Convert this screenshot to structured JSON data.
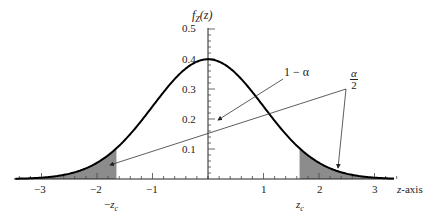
{
  "chart_data": {
    "type": "area",
    "title": "",
    "xlabel": "z-axis",
    "ylabel": "f_Z(z)",
    "xlim": [
      -3.5,
      3.5
    ],
    "ylim": [
      0,
      0.5
    ],
    "grid": false,
    "x_ticks": [
      -3,
      -2,
      -1,
      1,
      2,
      3
    ],
    "x_tick_labels": [
      "−3",
      "−2",
      "−1",
      "1",
      "2",
      "3"
    ],
    "y_ticks": [
      0.1,
      0.2,
      0.3,
      0.4,
      0.5
    ],
    "y_tick_labels": [
      "0.1",
      "0.2",
      "0.3",
      "0.4",
      "0.5"
    ],
    "series": [
      {
        "name": "standard normal density",
        "function": "exp(-z^2/2)/sqrt(2*pi)",
        "peak": 0.399
      }
    ],
    "critical_values": {
      "lower": -1.65,
      "upper": 1.65
    },
    "shaded_regions": [
      {
        "from": -3.5,
        "to": -1.65,
        "label": "α/2"
      },
      {
        "from": 1.65,
        "to": 3.5,
        "label": "α/2"
      }
    ],
    "annotations": [
      {
        "text": "1 − α",
        "points_to": "central area"
      },
      {
        "text": "α/2",
        "points_to": "both tails"
      },
      {
        "text": "−z_c",
        "at_x": -1.65
      },
      {
        "text": "z_c",
        "at_x": 1.65
      }
    ]
  },
  "labels": {
    "ylabel_f": "f",
    "ylabel_sub": "Z",
    "ylabel_arg": "(z)",
    "xaxis": "z-axis",
    "one_minus_alpha": "1 − α",
    "alpha": "α",
    "two": "2",
    "neg_zc_minus": "−",
    "zc_z": "z",
    "zc_sub": "c",
    "xticks": [
      "−3",
      "−2",
      "−1",
      "1",
      "2",
      "3"
    ],
    "yticks": [
      "0.5",
      "0.4",
      "0.3",
      "0.2",
      "0.1"
    ]
  }
}
